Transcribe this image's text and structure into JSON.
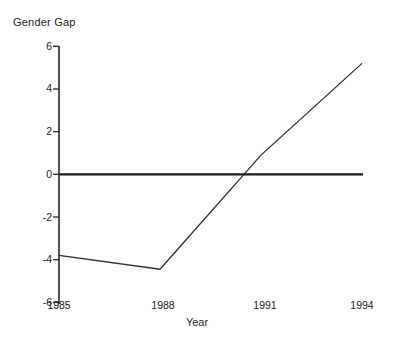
{
  "chart_data": {
    "type": "line",
    "title": "Gender Gap",
    "xlabel": "Year",
    "ylabel": "",
    "x": [
      1985,
      1988,
      1991,
      1994
    ],
    "series": [
      {
        "name": "Gender Gap",
        "values": [
          -3.8,
          -4.45,
          0.9,
          5.2
        ]
      }
    ],
    "xlim": [
      1985,
      1994
    ],
    "ylim": [
      -6,
      6
    ],
    "xticks": [
      1985,
      1988,
      1991,
      1994
    ],
    "yticks": [
      6,
      4,
      2,
      0,
      -2,
      -4,
      -6
    ],
    "xtick_labels": [
      "1985",
      "1988",
      "1991",
      "1994"
    ],
    "ytick_labels": [
      "6",
      "4",
      "2",
      "0",
      "-2",
      "-4",
      "-6"
    ],
    "grid": false,
    "legend": false,
    "zero_reference_line": 0,
    "zero_crossing_year": 1990.4,
    "colors": {
      "line": "#2b2b2b",
      "axis": "#262626",
      "zero_line": "#1a1a1a",
      "background": "#ffffff",
      "text": "#1a1a1a"
    }
  },
  "axis": {
    "y_ticks": [
      {
        "label": "6",
        "value": 6
      },
      {
        "label": "4",
        "value": 4
      },
      {
        "label": "2",
        "value": 2
      },
      {
        "label": "0",
        "value": 0
      },
      {
        "label": "-2",
        "value": -2
      },
      {
        "label": "-4",
        "value": -4
      },
      {
        "label": "-6",
        "value": -6
      }
    ],
    "x_ticks": [
      {
        "label": "1985",
        "value": 1985
      },
      {
        "label": "1988",
        "value": 1988
      },
      {
        "label": "1991",
        "value": 1991
      },
      {
        "label": "1994",
        "value": 1994
      }
    ]
  }
}
